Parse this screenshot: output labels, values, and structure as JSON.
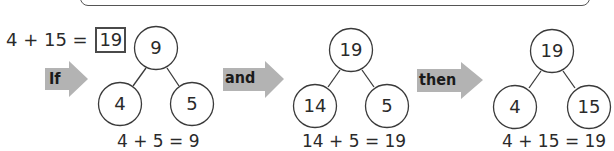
{
  "problem": {
    "equation_left": "4 + 15 = ",
    "answer": "19"
  },
  "steps": [
    {
      "connector": "If",
      "tree": {
        "whole": "9",
        "part_left": "4",
        "part_right": "5"
      },
      "equation": "4 + 5 = 9"
    },
    {
      "connector": "and",
      "tree": {
        "whole": "19",
        "part_left": "14",
        "part_right": "5"
      },
      "equation": "14 + 5 = 19"
    },
    {
      "connector": "then",
      "tree": {
        "whole": "19",
        "part_left": "4",
        "part_right": "15"
      },
      "equation": "4 + 15 = 19"
    }
  ],
  "colors": {
    "arrow_fill": "#b3b3b3",
    "stroke": "#3a3a3a",
    "answer_box_border": "#4a4a4a"
  }
}
